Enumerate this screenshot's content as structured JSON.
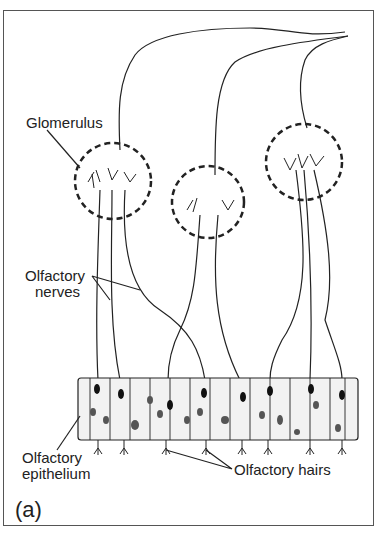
{
  "diagram": {
    "panel_label": "(a)",
    "labels": {
      "glomerulus": "Glomerulus",
      "nerves_line1": "Olfactory",
      "nerves_line2": "nerves",
      "epithelium_line1": "Olfactory",
      "epithelium_line2": "epithelium",
      "hairs": "Olfactory hairs"
    },
    "glomeruli_count": 3,
    "colors": {
      "ink": "#222222",
      "frame": "#555555",
      "background": "#ffffff"
    }
  }
}
